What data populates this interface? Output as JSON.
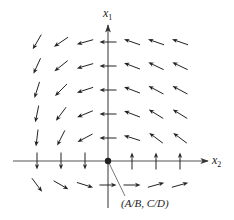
{
  "diagram": {
    "type": "phase-portrait-vector-field",
    "axes": {
      "vertical": {
        "label": "x",
        "subscript": "1",
        "x": 108,
        "y_top": 25,
        "y_bottom": 208
      },
      "horizontal": {
        "label": "x",
        "subscript": "2",
        "y": 161,
        "x_left": 13,
        "x_right": 208
      }
    },
    "equilibrium_point": {
      "x": 108,
      "y": 161,
      "label": "(A/B, C/D)",
      "label_x": 121,
      "label_y": 207,
      "leader_end": [
        125,
        196
      ]
    },
    "colors": {
      "ink": "#222222",
      "axis": "#555555",
      "background": "#ffffff"
    },
    "arrow_length": 17,
    "arrows": [
      {
        "x": 37,
        "y": 42,
        "dx": -0.5,
        "dy": 0.87
      },
      {
        "x": 61,
        "y": 42,
        "dx": -0.83,
        "dy": 0.56
      },
      {
        "x": 85,
        "y": 42,
        "dx": -0.96,
        "dy": 0.27
      },
      {
        "x": 108,
        "y": 42,
        "dx": -1,
        "dy": 0
      },
      {
        "x": 132,
        "y": 42,
        "dx": -0.94,
        "dy": -0.33
      },
      {
        "x": 156,
        "y": 42,
        "dx": -0.94,
        "dy": -0.33
      },
      {
        "x": 180,
        "y": 42,
        "dx": -0.94,
        "dy": -0.33
      },
      {
        "x": 37,
        "y": 66,
        "dx": -0.42,
        "dy": 0.91
      },
      {
        "x": 61,
        "y": 66,
        "dx": -0.78,
        "dy": 0.62
      },
      {
        "x": 85,
        "y": 66,
        "dx": -0.96,
        "dy": 0.28
      },
      {
        "x": 108,
        "y": 66,
        "dx": -1,
        "dy": 0
      },
      {
        "x": 132,
        "y": 66,
        "dx": -0.93,
        "dy": -0.36
      },
      {
        "x": 156,
        "y": 66,
        "dx": -0.9,
        "dy": -0.43
      },
      {
        "x": 180,
        "y": 66,
        "dx": -0.9,
        "dy": -0.43
      },
      {
        "x": 37,
        "y": 90,
        "dx": -0.3,
        "dy": 0.95
      },
      {
        "x": 61,
        "y": 90,
        "dx": -0.7,
        "dy": 0.71
      },
      {
        "x": 85,
        "y": 90,
        "dx": -0.95,
        "dy": 0.31
      },
      {
        "x": 108,
        "y": 90,
        "dx": -1,
        "dy": 0
      },
      {
        "x": 132,
        "y": 90,
        "dx": -0.93,
        "dy": -0.36
      },
      {
        "x": 156,
        "y": 90,
        "dx": -0.88,
        "dy": -0.47
      },
      {
        "x": 180,
        "y": 90,
        "dx": -0.88,
        "dy": -0.47
      },
      {
        "x": 37,
        "y": 114,
        "dx": -0.2,
        "dy": 0.98
      },
      {
        "x": 61,
        "y": 114,
        "dx": -0.6,
        "dy": 0.8
      },
      {
        "x": 85,
        "y": 114,
        "dx": -0.92,
        "dy": 0.38
      },
      {
        "x": 108,
        "y": 114,
        "dx": -1,
        "dy": 0
      },
      {
        "x": 132,
        "y": 114,
        "dx": -0.93,
        "dy": -0.36
      },
      {
        "x": 156,
        "y": 114,
        "dx": -0.85,
        "dy": -0.52
      },
      {
        "x": 180,
        "y": 114,
        "dx": -0.85,
        "dy": -0.52
      },
      {
        "x": 37,
        "y": 138,
        "dx": -0.12,
        "dy": 0.99
      },
      {
        "x": 61,
        "y": 138,
        "dx": -0.45,
        "dy": 0.89
      },
      {
        "x": 85,
        "y": 138,
        "dx": -0.88,
        "dy": 0.47
      },
      {
        "x": 108,
        "y": 138,
        "dx": -1,
        "dy": 0
      },
      {
        "x": 132,
        "y": 138,
        "dx": -0.95,
        "dy": -0.3
      },
      {
        "x": 156,
        "y": 138,
        "dx": -0.8,
        "dy": -0.6
      },
      {
        "x": 180,
        "y": 138,
        "dx": -0.8,
        "dy": -0.6
      },
      {
        "x": 37,
        "y": 161,
        "dx": 0,
        "dy": 1
      },
      {
        "x": 61,
        "y": 161,
        "dx": 0,
        "dy": 1
      },
      {
        "x": 85,
        "y": 161,
        "dx": 0,
        "dy": 1
      },
      {
        "x": 132,
        "y": 161,
        "dx": 0,
        "dy": -1
      },
      {
        "x": 156,
        "y": 161,
        "dx": 0,
        "dy": -1
      },
      {
        "x": 180,
        "y": 161,
        "dx": 0,
        "dy": -1
      },
      {
        "x": 37,
        "y": 185,
        "dx": 0.6,
        "dy": 0.8
      },
      {
        "x": 61,
        "y": 185,
        "dx": 0.87,
        "dy": 0.5
      },
      {
        "x": 85,
        "y": 185,
        "dx": 0.95,
        "dy": 0.3
      },
      {
        "x": 108,
        "y": 185,
        "dx": 1,
        "dy": 0
      },
      {
        "x": 132,
        "y": 185,
        "dx": 1,
        "dy": 0
      },
      {
        "x": 156,
        "y": 185,
        "dx": 0.96,
        "dy": -0.27
      },
      {
        "x": 180,
        "y": 185,
        "dx": 0.96,
        "dy": -0.27
      }
    ]
  }
}
